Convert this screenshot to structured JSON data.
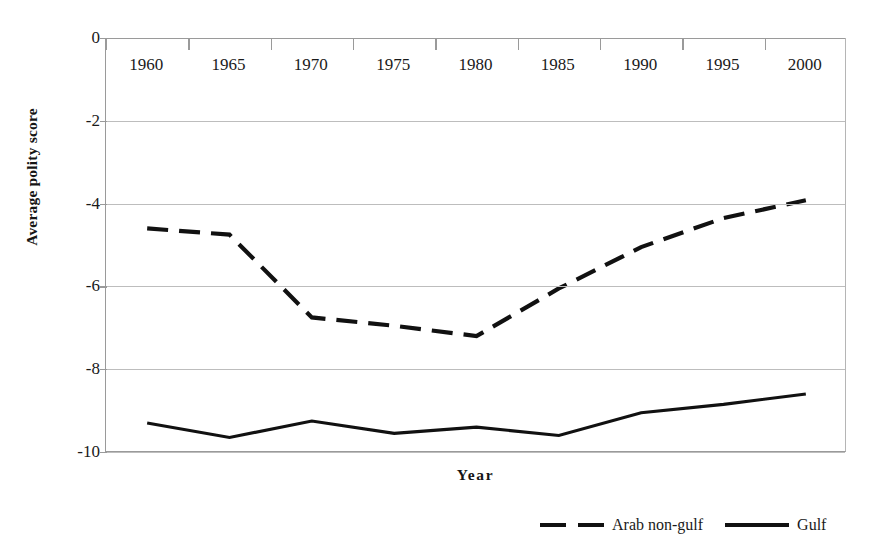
{
  "chart_data": {
    "type": "line",
    "title": "",
    "xlabel": "Year",
    "ylabel": "Average polity score",
    "categories": [
      "1960",
      "1965",
      "1970",
      "1975",
      "1980",
      "1985",
      "1990",
      "1995",
      "2000"
    ],
    "x": [
      1960,
      1965,
      1970,
      1975,
      1980,
      1985,
      1990,
      1995,
      2000
    ],
    "xlim": [
      1960,
      2000
    ],
    "ylim": [
      -10,
      0
    ],
    "y_ticks": [
      "0",
      "-2",
      "-4",
      "-6",
      "-8",
      "-10"
    ],
    "y_tick_values": [
      0,
      -2,
      -4,
      -6,
      -8,
      -10
    ],
    "grid": true,
    "legend_position": "bottom-right",
    "series": [
      {
        "name": "Arab non-gulf",
        "style": "dashed",
        "color": "#111111",
        "values": [
          -4.6,
          -4.75,
          -6.75,
          -6.95,
          -7.2,
          -6.05,
          -5.05,
          -4.35,
          -3.92
        ]
      },
      {
        "name": "Gulf",
        "style": "solid",
        "color": "#111111",
        "values": [
          -9.3,
          -9.65,
          -9.25,
          -9.55,
          -9.4,
          -9.6,
          -9.05,
          -8.85,
          -8.6
        ]
      }
    ]
  },
  "axes": {
    "y_title": "Average polity score",
    "x_title": "Year"
  },
  "legend": {
    "items": [
      {
        "label": "Arab non-gulf",
        "style": "dashed"
      },
      {
        "label": "Gulf",
        "style": "solid"
      }
    ]
  }
}
